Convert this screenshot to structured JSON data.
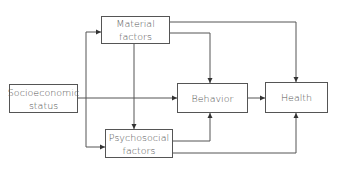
{
  "diagram": {
    "nodes": {
      "material": {
        "label_line1": "Material",
        "label_line2": "factors"
      },
      "socioeconomic": {
        "label_line1": "Socioeconomic",
        "label_line2": "status"
      },
      "psychosocial": {
        "label_line1": "Psychosocial",
        "label_line2": "factors"
      },
      "behavior": {
        "label": "Behavior"
      },
      "health": {
        "label": "Health"
      }
    },
    "edges": [
      {
        "from": "Socioeconomic status",
        "to": "Material factors"
      },
      {
        "from": "Socioeconomic status",
        "to": "Psychosocial factors"
      },
      {
        "from": "Socioeconomic status",
        "to": "Behavior"
      },
      {
        "from": "Material factors",
        "to": "Psychosocial factors"
      },
      {
        "from": "Material factors",
        "to": "Behavior"
      },
      {
        "from": "Material factors",
        "to": "Health"
      },
      {
        "from": "Psychosocial factors",
        "to": "Behavior"
      },
      {
        "from": "Psychosocial factors",
        "to": "Health"
      },
      {
        "from": "Behavior",
        "to": "Health"
      }
    ],
    "colors": {
      "line": "#555555",
      "text": "#555555"
    }
  }
}
